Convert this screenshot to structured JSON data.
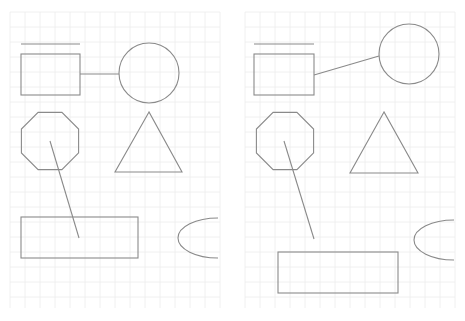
{
  "canvas": {
    "width": 465,
    "height": 321,
    "background": "#ffffff",
    "grid_color": "#ececec",
    "stroke_color": "#8a8a8a"
  },
  "panels": [
    {
      "name": "left-panel",
      "grid": {
        "x0": 10,
        "y0": 12,
        "x1": 220,
        "y1": 308,
        "step": 15
      },
      "shapes": {
        "bar_line": {
          "x1": 21,
          "y1": 44,
          "x2": 80,
          "y2": 44
        },
        "square": {
          "x": 21,
          "y": 54,
          "w": 59,
          "h": 41
        },
        "square_circle_connector": {
          "x1": 80,
          "y1": 74,
          "x2": 119,
          "y2": 74
        },
        "circle": {
          "cx": 149,
          "cy": 73,
          "r": 30
        },
        "octagon": {
          "cx": 50,
          "cy": 141,
          "r": 31
        },
        "triangle": {
          "points": [
            [
              149,
              112
            ],
            [
              115,
              172
            ],
            [
              182,
              172
            ]
          ]
        },
        "octagon_rect_connector": {
          "x1": 50,
          "y1": 141,
          "x2": 79,
          "y2": 238
        },
        "rect": {
          "x": 21,
          "y": 217,
          "w": 117,
          "h": 41
        },
        "ellipse_arc": {
          "cx": 218,
          "cy": 238,
          "rx": 40,
          "ry": 20
        }
      }
    },
    {
      "name": "right-panel",
      "grid": {
        "x0": 245,
        "y0": 12,
        "x1": 455,
        "y1": 308,
        "step": 15
      },
      "shapes": {
        "bar_line": {
          "x1": 254,
          "y1": 44,
          "x2": 314,
          "y2": 44
        },
        "square": {
          "x": 254,
          "y": 54,
          "w": 60,
          "h": 41
        },
        "square_circle_connector": {
          "x1": 314,
          "y1": 75,
          "x2": 379,
          "y2": 56
        },
        "circle": {
          "cx": 409,
          "cy": 54,
          "r": 30
        },
        "octagon": {
          "cx": 285,
          "cy": 141,
          "r": 31
        },
        "triangle": {
          "points": [
            [
              384,
              112
            ],
            [
              350,
              173
            ],
            [
              418,
              173
            ]
          ]
        },
        "octagon_rect_connector": {
          "x1": 284,
          "y1": 141,
          "x2": 314,
          "y2": 239
        },
        "rect": {
          "x": 278,
          "y": 252,
          "w": 120,
          "h": 41
        },
        "ellipse_arc": {
          "cx": 454,
          "cy": 240,
          "rx": 40,
          "ry": 20
        }
      }
    }
  ]
}
